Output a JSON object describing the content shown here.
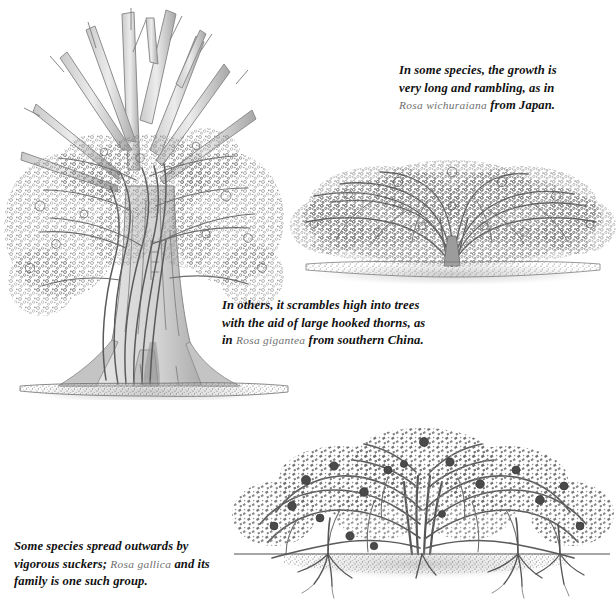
{
  "page": {
    "background_color": "#ffffff",
    "ink_color": "#3a3a3a",
    "species_name_color": "#6f6f6f",
    "text_color": "#111111",
    "width": 616,
    "height": 605
  },
  "captions": {
    "rambling": {
      "line1": "In some species, the growth is",
      "line2": "very long and rambling, as in",
      "line3_species": "Rosa wichuraiana",
      "line3_rest": " from Japan."
    },
    "scrambling": {
      "line1": "In others, it scrambles high into trees",
      "line2": "with the aid of large hooked thorns, as",
      "line3_prefix": "in ",
      "line3_species": "Rosa  gigantea",
      "line3_rest": " from southern China."
    },
    "suckering": {
      "line1": "Some species spread outwards by",
      "line2_prefix": "vigorous suckers; ",
      "line2_species": "Rosa  gallica",
      "line2_rest": " and its",
      "line3": "family is one such group."
    }
  },
  "figures": {
    "tree_climber": {
      "name": "Rose scrambling high into a large tree",
      "description": "Tall buttressed tree trunk with bare upper limbs; a vigorous climbing rose wraps the trunk and fills the lower canopy with pale blossom clusters; ground line with stippled soil at base.",
      "trunk_fill": "#cfcfcf",
      "trunk_shadow": "#9a9a9a"
    },
    "rambler_mound": {
      "name": "Low rambling rose forming a wide mound",
      "description": "Very wide, low dome of dense blossom radiating from a short central crown; arching canes fan outwards; soft cast shadow on ground.",
      "canopy_tone": "#8c8c8c"
    },
    "suckering_shrub": {
      "name": "Suckering rose spreading outwards",
      "description": "Broad arching shrub with dark blooms and hips; a straight ground line with stippled soil; root suckers descend and new shoots rise at intervals away from the main crown.",
      "bloom_tone": "#4a4a4a"
    }
  }
}
